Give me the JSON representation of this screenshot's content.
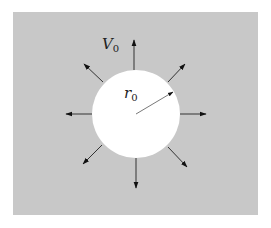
{
  "diagram": {
    "background_color": "#c8c8c8",
    "circle_color": "#ffffff",
    "arrow_color": "#111111",
    "labels": {
      "velocity": {
        "main": "V",
        "sub": "0"
      },
      "radius": {
        "main": "r",
        "sub": "0"
      }
    },
    "arrow_count": 8
  }
}
